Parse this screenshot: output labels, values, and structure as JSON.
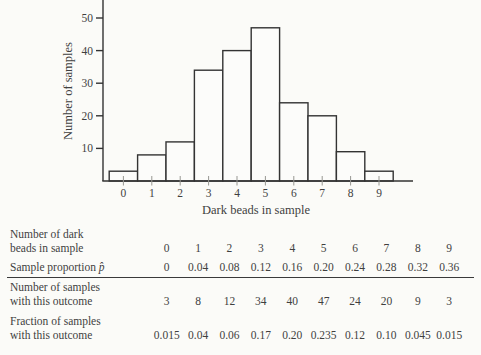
{
  "chart_data": {
    "type": "bar",
    "title": "",
    "xlabel": "Dark beads in sample",
    "ylabel": "Number of samples",
    "categories": [
      "0",
      "1",
      "2",
      "3",
      "4",
      "5",
      "6",
      "7",
      "8",
      "9"
    ],
    "values": [
      3,
      8,
      12,
      34,
      40,
      47,
      24,
      20,
      9,
      3
    ],
    "ylim": [
      0,
      55.5
    ],
    "yticks": [
      10,
      20,
      30,
      40,
      50
    ],
    "grid": false,
    "legend": "none",
    "bar_fill": "#fcfcfa",
    "stroke_color": "#333333"
  },
  "table": {
    "rows": [
      {
        "label_lines": [
          "Number of dark",
          "beads in sample"
        ],
        "values": [
          "0",
          "1",
          "2",
          "3",
          "4",
          "5",
          "6",
          "7",
          "8",
          "9"
        ]
      },
      {
        "label_lines": [
          "Sample proportion"
        ],
        "symbol": "p̂",
        "values": [
          "0",
          "0.04",
          "0.08",
          "0.12",
          "0.16",
          "0.20",
          "0.24",
          "0.28",
          "0.32",
          "0.36"
        ]
      },
      {
        "label_lines": [
          "Number of samples",
          "with this outcome"
        ],
        "values": [
          "3",
          "8",
          "12",
          "34",
          "40",
          "47",
          "24",
          "20",
          "9",
          "3"
        ]
      },
      {
        "label_lines": [
          "Fraction of samples",
          "with this outcome"
        ],
        "values": [
          "0.015",
          "0.04",
          "0.06",
          "0.17",
          "0.20",
          "0.235",
          "0.12",
          "0.10",
          "0.045",
          "0.015"
        ]
      }
    ]
  },
  "colors": {
    "background": "#fbfbf8",
    "ink": "#3f3f3f",
    "line": "#333333"
  }
}
